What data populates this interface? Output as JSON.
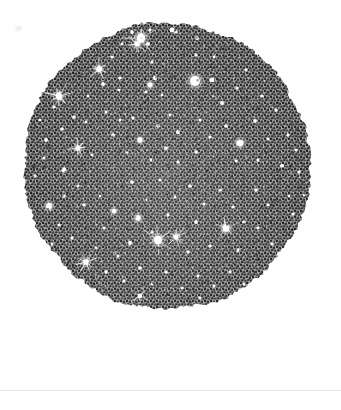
{
  "plate": {
    "title": "Engraved star-field plate",
    "caption": "",
    "width": 341,
    "height": 410,
    "background_color": "#fefefe",
    "paper_color": "#ffffff"
  },
  "rule": {
    "name": "plate-baseline-rule",
    "y": 390,
    "x": 0,
    "width": 341,
    "thickness": 1,
    "color": "#e6e7e9"
  },
  "margin_speck": {
    "x": 15,
    "y": 26,
    "width": 7,
    "height": 5,
    "color": "#f0f0f1"
  },
  "disc": {
    "name": "star-field-disc",
    "center_x": 167,
    "center_y": 166,
    "radius": 143,
    "edge_style": "ragged",
    "fill_technique": "stipple-engraving",
    "ink_color": "#2b2b2b",
    "ground_color": "#b9b9b9",
    "mean_tone": "#6a6a6a",
    "star_color": "#ffffff"
  },
  "chart_data": {
    "type": "scatter",
    "title": "Engraved star-field plate",
    "subtitle": "",
    "xlabel": "",
    "ylabel": "",
    "xlim": [
      24,
      310
    ],
    "ylim": [
      24,
      308
    ],
    "grid": false,
    "legend": null,
    "projection": "circular-disc",
    "marker": "white-star-dot",
    "background": "stipple-engraved-dark-ground",
    "series": [
      {
        "name": "stars",
        "units": "pixels",
        "fields": [
          "x",
          "y",
          "r",
          "spikes"
        ],
        "points": [
          [
            132,
            32,
            2.0,
            0
          ],
          [
            150,
            30,
            1.6,
            0
          ],
          [
            172,
            30,
            2.2,
            0
          ],
          [
            141,
            38,
            4.2,
            1
          ],
          [
            137,
            44,
            2.6,
            1
          ],
          [
            148,
            44,
            1.8,
            0
          ],
          [
            176,
            32,
            1.6,
            0
          ],
          [
            197,
            38,
            1.7,
            0
          ],
          [
            99,
            69,
            2.9,
            1
          ],
          [
            112,
            57,
            1.5,
            0
          ],
          [
            120,
            78,
            1.6,
            0
          ],
          [
            103,
            84,
            1.8,
            0
          ],
          [
            119,
            90,
            1.4,
            0
          ],
          [
            152,
            62,
            1.6,
            0
          ],
          [
            155,
            78,
            2.0,
            0
          ],
          [
            150,
            85,
            2.6,
            0
          ],
          [
            146,
            92,
            1.6,
            0
          ],
          [
            162,
            95,
            1.5,
            0
          ],
          [
            195,
            81,
            4.6,
            0
          ],
          [
            212,
            80,
            2.2,
            0
          ],
          [
            196,
            55,
            1.5,
            0
          ],
          [
            222,
            103,
            1.8,
            0
          ],
          [
            237,
            88,
            1.5,
            0
          ],
          [
            59,
            96,
            3.4,
            1
          ],
          [
            54,
            107,
            1.6,
            0
          ],
          [
            46,
            140,
            1.9,
            0
          ],
          [
            62,
            129,
            1.7,
            0
          ],
          [
            44,
            158,
            1.7,
            0
          ],
          [
            74,
            117,
            1.6,
            0
          ],
          [
            86,
            122,
            1.5,
            0
          ],
          [
            78,
            148,
            2.4,
            1
          ],
          [
            92,
            155,
            1.5,
            0
          ],
          [
            64,
            170,
            2.2,
            0
          ],
          [
            106,
            112,
            1.5,
            0
          ],
          [
            120,
            120,
            1.6,
            0
          ],
          [
            113,
            135,
            1.8,
            0
          ],
          [
            133,
            118,
            1.7,
            0
          ],
          [
            140,
            140,
            2.4,
            0
          ],
          [
            127,
            153,
            1.5,
            0
          ],
          [
            158,
            126,
            1.6,
            0
          ],
          [
            170,
            115,
            1.6,
            0
          ],
          [
            178,
            132,
            2.0,
            0
          ],
          [
            166,
            148,
            1.8,
            0
          ],
          [
            151,
            160,
            1.5,
            0
          ],
          [
            200,
            120,
            1.6,
            0
          ],
          [
            210,
            137,
            1.5,
            0
          ],
          [
            196,
            152,
            1.7,
            0
          ],
          [
            226,
            126,
            1.6,
            0
          ],
          [
            240,
            143,
            3.3,
            0
          ],
          [
            236,
            161,
            1.6,
            0
          ],
          [
            255,
            121,
            2.1,
            0
          ],
          [
            268,
            139,
            1.5,
            0
          ],
          [
            258,
            160,
            1.6,
            0
          ],
          [
            276,
            110,
            1.8,
            0
          ],
          [
            288,
            135,
            1.5,
            0
          ],
          [
            282,
            166,
            2.0,
            0
          ],
          [
            296,
            150,
            1.5,
            0
          ],
          [
            299,
            172,
            1.9,
            0
          ],
          [
            289,
            196,
            1.5,
            0
          ],
          [
            64,
            196,
            1.6,
            0
          ],
          [
            49,
            206,
            3.0,
            0
          ],
          [
            78,
            186,
            1.6,
            0
          ],
          [
            84,
            205,
            1.7,
            0
          ],
          [
            59,
            225,
            1.6,
            0
          ],
          [
            72,
            238,
            1.7,
            0
          ],
          [
            100,
            196,
            1.5,
            0
          ],
          [
            114,
            211,
            2.4,
            0
          ],
          [
            104,
            228,
            1.7,
            0
          ],
          [
            96,
            248,
            1.6,
            0
          ],
          [
            118,
            256,
            1.6,
            0
          ],
          [
            132,
            182,
            1.7,
            0
          ],
          [
            146,
            200,
            1.5,
            0
          ],
          [
            138,
            218,
            2.8,
            0
          ],
          [
            152,
            232,
            1.6,
            0
          ],
          [
            130,
            243,
            2.0,
            0
          ],
          [
            160,
            180,
            1.6,
            0
          ],
          [
            175,
            197,
            1.6,
            0
          ],
          [
            168,
            215,
            1.7,
            0
          ],
          [
            158,
            240,
            4.0,
            1
          ],
          [
            176,
            237,
            2.6,
            1
          ],
          [
            190,
            186,
            1.6,
            0
          ],
          [
            204,
            204,
            1.5,
            0
          ],
          [
            196,
            222,
            1.8,
            0
          ],
          [
            188,
            252,
            1.6,
            0
          ],
          [
            210,
            246,
            1.6,
            0
          ],
          [
            220,
            190,
            1.7,
            0
          ],
          [
            233,
            207,
            1.6,
            0
          ],
          [
            226,
            228,
            3.4,
            1
          ],
          [
            244,
            222,
            1.6,
            0
          ],
          [
            238,
            250,
            1.7,
            0
          ],
          [
            256,
            190,
            1.6,
            0
          ],
          [
            268,
            205,
            1.5,
            0
          ],
          [
            258,
            228,
            1.6,
            0
          ],
          [
            272,
            244,
            1.5,
            0
          ],
          [
            86,
            262,
            2.8,
            1
          ],
          [
            106,
            272,
            1.6,
            0
          ],
          [
            124,
            281,
            1.6,
            0
          ],
          [
            140,
            268,
            1.6,
            0
          ],
          [
            152,
            284,
            1.5,
            0
          ],
          [
            166,
            272,
            1.7,
            0
          ],
          [
            182,
            288,
            1.6,
            0
          ],
          [
            198,
            276,
            1.5,
            0
          ],
          [
            214,
            286,
            1.6,
            0
          ],
          [
            230,
            272,
            1.6,
            0
          ],
          [
            244,
            284,
            1.5,
            0
          ],
          [
            140,
            296,
            2.2,
            1
          ],
          [
            200,
            298,
            1.5,
            0
          ],
          [
            35,
            176,
            1.6,
            0
          ],
          [
            40,
            120,
            1.5,
            0
          ],
          [
            52,
            244,
            1.5,
            0
          ],
          [
            304,
            195,
            1.5,
            0
          ],
          [
            293,
            214,
            1.6,
            0
          ],
          [
            276,
            262,
            1.7,
            0
          ],
          [
            122,
            44,
            1.5,
            0
          ],
          [
            214,
            57,
            1.4,
            0
          ],
          [
            246,
            70,
            1.6,
            0
          ],
          [
            262,
            96,
            1.6,
            0
          ],
          [
            178,
            162,
            1.5,
            0
          ],
          [
            88,
            96,
            1.4,
            0
          ]
        ]
      }
    ]
  }
}
